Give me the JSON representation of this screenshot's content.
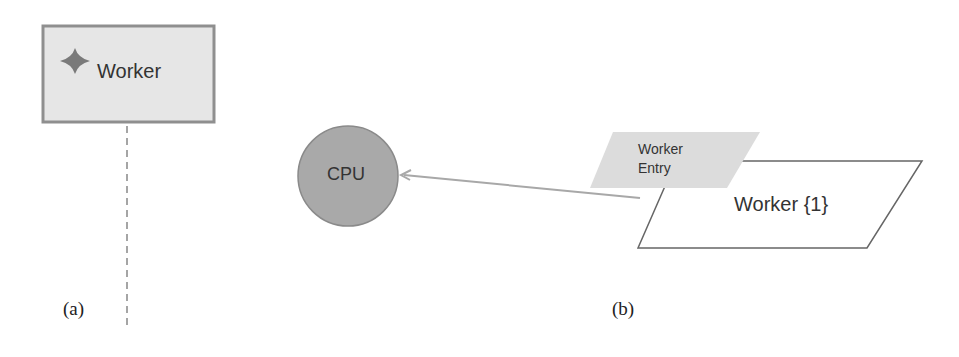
{
  "panel_a": {
    "caption": "(a)",
    "box": {
      "label": "Worker",
      "icon": "four-point-star-icon",
      "fill": "#e6e6e6",
      "border": "#8f8f8f"
    }
  },
  "panel_b": {
    "caption": "(b)",
    "cpu": {
      "label": "CPU",
      "fill": "#a9a9a9",
      "border": "#8a8a8a"
    },
    "entry": {
      "line1": "Worker",
      "line2": "Entry",
      "fill": "#dcdcdc"
    },
    "worker": {
      "label": "Worker {1}"
    },
    "arrow_color": "#a8a8a8"
  }
}
